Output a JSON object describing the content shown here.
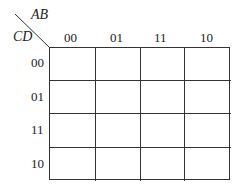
{
  "kmap": {
    "col_variables": "AB",
    "row_variables": "CD",
    "col_headers": [
      "00",
      "01",
      "11",
      "10"
    ],
    "row_headers": [
      "00",
      "01",
      "11",
      "10"
    ],
    "cells": [
      [
        "",
        "",
        "",
        ""
      ],
      [
        "",
        "",
        "",
        ""
      ],
      [
        "",
        "",
        "",
        ""
      ],
      [
        "",
        "",
        "",
        ""
      ]
    ]
  }
}
